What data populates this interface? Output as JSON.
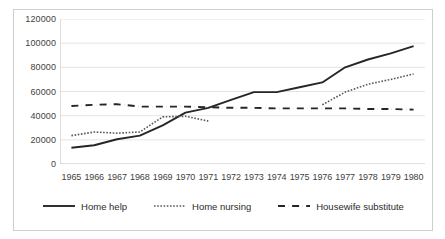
{
  "chart_data": {
    "type": "line",
    "title": "",
    "xlabel": "",
    "ylabel": "",
    "grid": true,
    "legend_position": "bottom",
    "ylim": [
      0,
      120000
    ],
    "yticks": [
      0,
      20000,
      40000,
      60000,
      80000,
      100000,
      120000
    ],
    "ytick_labels": [
      "0",
      "20000",
      "40000",
      "60000",
      "80000",
      "100000",
      "120000"
    ],
    "categories": [
      "1965",
      "1966",
      "1967",
      "1968",
      "1969",
      "1970",
      "1971",
      "1972",
      "1973",
      "1974",
      "1975",
      "1976",
      "1977",
      "1978",
      "1979",
      "1980"
    ],
    "series": [
      {
        "name": "Home help",
        "style": "solid",
        "color": "#262626",
        "values": [
          13500,
          15500,
          20500,
          23500,
          32000,
          42500,
          46500,
          53000,
          59500,
          59500,
          63500,
          67500,
          80000,
          86500,
          91500,
          97500
        ]
      },
      {
        "name": "Home nursing",
        "style": "dotted",
        "color": "#595959",
        "values": [
          23500,
          26500,
          25500,
          26500,
          39000,
          39500,
          35500,
          null,
          null,
          null,
          null,
          49000,
          59500,
          66000,
          70000,
          74500
        ]
      },
      {
        "name": "Housewife substitute",
        "style": "dashed",
        "color": "#262626",
        "values": [
          48000,
          49000,
          49500,
          47500,
          47500,
          47500,
          47000,
          46500,
          46500,
          46000,
          46000,
          46000,
          46000,
          45500,
          45500,
          45000
        ]
      }
    ]
  },
  "legend": {
    "items": [
      {
        "label": "Home help",
        "icon": "solid-line-icon"
      },
      {
        "label": "Home nursing",
        "icon": "dotted-line-icon"
      },
      {
        "label": "Housewife substitute",
        "icon": "dashed-line-icon"
      }
    ]
  }
}
